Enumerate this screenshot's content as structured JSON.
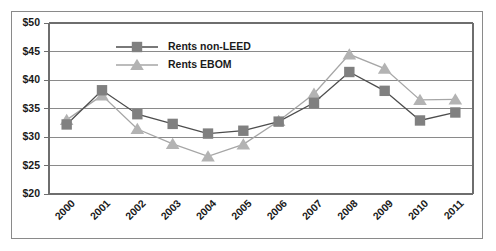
{
  "chart_data": {
    "type": "line",
    "title": "",
    "xlabel": "",
    "ylabel": "",
    "categories": [
      "2000",
      "2001",
      "2002",
      "2003",
      "2004",
      "2005",
      "2006",
      "2007",
      "2008",
      "2009",
      "2010",
      "2011"
    ],
    "ylim": [
      20,
      50
    ],
    "ytick_values": [
      20,
      25,
      30,
      35,
      40,
      45,
      50
    ],
    "ytick_labels": [
      "$20",
      "$25",
      "$30",
      "$35",
      "$40",
      "$45",
      "$50"
    ],
    "grid": true,
    "legend_position": "upper-center",
    "series": [
      {
        "name": "Rents non-LEED",
        "marker": "square",
        "color": "#808080",
        "line_color": "#4d4d4d",
        "values": [
          32.2,
          38.2,
          34.0,
          32.3,
          30.6,
          31.1,
          32.7,
          36.0,
          41.4,
          38.1,
          32.9,
          34.3
        ]
      },
      {
        "name": "Rents EBOM",
        "marker": "triangle",
        "color": "#b3b3b3",
        "line_color": "#a6a6a6",
        "values": [
          33.0,
          37.3,
          31.4,
          28.8,
          26.6,
          28.7,
          32.8,
          37.6,
          44.5,
          42.0,
          36.5,
          36.6
        ]
      }
    ]
  },
  "legend": {
    "entries": [
      {
        "label": "Rents non-LEED"
      },
      {
        "label": "Rents EBOM"
      }
    ]
  }
}
